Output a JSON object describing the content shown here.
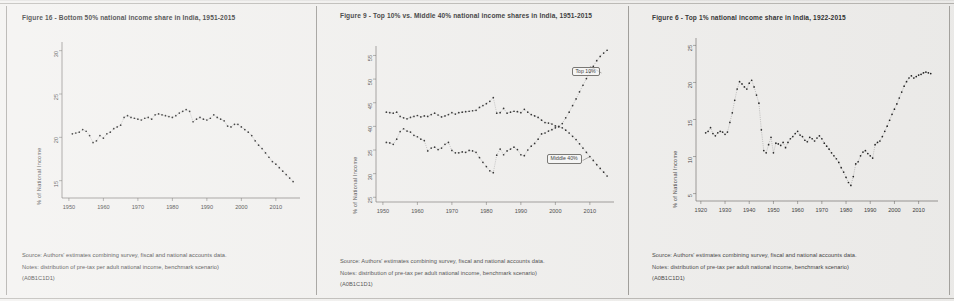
{
  "document": {
    "kind": "scanned-figure-sheet",
    "panel_count": 3
  },
  "common": {
    "ylabel": "% of National Income",
    "source_line": "Source: Authors' estimates combining survey, fiscal and national accounts data.",
    "notes_line": "Notes: distribution of pre-tax per adult national income, benchmark scenario)",
    "code_line": "(A0B1C1D1)"
  },
  "panels": [
    {
      "title": "Figure 16 - Bottom 50% national income share in India, 1951-2015",
      "source": "Source: Authors' estimates combining survey, fiscal and national accounts data.",
      "notes": "Notes: distribution of pre-tax per adult national income, benchmark scenario)",
      "code": "(A0B1C1D1)"
    },
    {
      "title": "Figure 9 - Top 10% vs. Middle 40% national income shares in India, 1951-2015",
      "source": "Source: Authors' estimates combining survey, fiscal and national accounts data.",
      "notes": "Notes: distribution of pre-tax per adult national income, benchmark scenario)",
      "code": "(A0B1C1D1)"
    },
    {
      "title": "Figure 6 - Top 1% national income share in India, 1922-2015",
      "source": "Source: Authors' estimates combining survey, fiscal and national accounts data.",
      "notes": "Notes: distribution of pre-tax per adult national income, benchmark scenario)",
      "code": "(A0B1C1D1)"
    }
  ],
  "chart_data": [
    {
      "type": "scatter",
      "title": "Figure 16 - Bottom 50% national income share in India, 1951-2015",
      "xlabel": "",
      "ylabel": "% of National Income",
      "grid": false,
      "legend": "none",
      "xlim": [
        1948,
        2017
      ],
      "ylim": [
        13,
        31
      ],
      "xticks": [
        1950,
        1960,
        1970,
        1980,
        1990,
        2000,
        2010
      ],
      "yticks": [
        15,
        20,
        25,
        30
      ],
      "series": [
        {
          "name": "Bottom 50%",
          "x": [
            1951,
            1952,
            1953,
            1954,
            1955,
            1956,
            1957,
            1958,
            1959,
            1960,
            1961,
            1962,
            1963,
            1964,
            1965,
            1966,
            1967,
            1968,
            1969,
            1970,
            1971,
            1972,
            1973,
            1974,
            1975,
            1976,
            1977,
            1978,
            1979,
            1980,
            1981,
            1982,
            1983,
            1984,
            1985,
            1986,
            1987,
            1988,
            1989,
            1990,
            1991,
            1992,
            1993,
            1994,
            1995,
            1996,
            1997,
            1998,
            1999,
            2000,
            2001,
            2002,
            2003,
            2004,
            2005,
            2006,
            2007,
            2008,
            2009,
            2010,
            2011,
            2012,
            2013,
            2014,
            2015
          ],
          "values": [
            20.4,
            20.5,
            20.6,
            20.9,
            20.7,
            20.2,
            19.4,
            19.6,
            20.2,
            19.9,
            20.4,
            20.6,
            21.0,
            21.2,
            21.4,
            22.3,
            22.5,
            22.3,
            22.2,
            22.1,
            22.0,
            22.2,
            22.3,
            22.1,
            22.6,
            22.7,
            22.6,
            22.5,
            22.4,
            22.3,
            22.5,
            22.8,
            23.0,
            23.2,
            23.0,
            21.8,
            22.1,
            22.3,
            22.1,
            22.0,
            22.2,
            22.6,
            22.3,
            22.1,
            21.9,
            21.3,
            21.2,
            21.5,
            21.5,
            21.2,
            20.9,
            20.6,
            20.2,
            19.6,
            19.1,
            18.7,
            18.2,
            17.7,
            17.2,
            16.9,
            16.5,
            16.1,
            15.7,
            15.3,
            14.9
          ]
        }
      ]
    },
    {
      "type": "scatter",
      "title": "Figure 9 - Top 10% vs. Middle 40% national income shares in India, 1951-2015",
      "xlabel": "",
      "ylabel": "% of National Income",
      "grid": false,
      "legend": "inline-annotations",
      "xlim": [
        1948,
        2017
      ],
      "ylim": [
        24,
        57
      ],
      "xticks": [
        1950,
        1960,
        1970,
        1980,
        1990,
        2000,
        2010
      ],
      "yticks": [
        25,
        30,
        35,
        40,
        45,
        50,
        55
      ],
      "annotations": [
        {
          "label": "Top 10%",
          "x": 2007,
          "y": 51.5
        },
        {
          "label": "Middle 40%",
          "x": 2005,
          "y": 33.0
        }
      ],
      "series": [
        {
          "name": "Middle 40%",
          "x": [
            1951,
            1952,
            1953,
            1954,
            1955,
            1956,
            1957,
            1958,
            1959,
            1960,
            1961,
            1962,
            1963,
            1964,
            1965,
            1966,
            1967,
            1968,
            1969,
            1970,
            1971,
            1972,
            1973,
            1974,
            1975,
            1976,
            1977,
            1978,
            1979,
            1980,
            1981,
            1982,
            1983,
            1984,
            1985,
            1986,
            1987,
            1988,
            1989,
            1990,
            1991,
            1992,
            1993,
            1994,
            1995,
            1996,
            1997,
            1998,
            1999,
            2000,
            2001,
            2002,
            2003,
            2004,
            2005,
            2006,
            2007,
            2008,
            2009,
            2010,
            2011,
            2012,
            2013,
            2014,
            2015
          ],
          "values": [
            43.0,
            42.9,
            42.8,
            43.0,
            42.1,
            41.8,
            41.6,
            41.9,
            42.1,
            42.3,
            42.0,
            42.2,
            42.1,
            42.5,
            42.8,
            42.4,
            42.0,
            42.2,
            42.5,
            42.9,
            42.6,
            42.9,
            43.0,
            43.1,
            43.2,
            43.3,
            43.4,
            44.0,
            44.4,
            44.8,
            45.3,
            46.1,
            42.8,
            42.9,
            43.8,
            42.8,
            43.0,
            43.2,
            43.1,
            42.9,
            43.6,
            43.0,
            42.5,
            42.2,
            41.9,
            41.3,
            40.8,
            40.7,
            40.5,
            40.1,
            39.9,
            39.7,
            39.2,
            38.6,
            37.9,
            37.2,
            36.3,
            35.4,
            34.5,
            33.6,
            32.8,
            31.9,
            31.1,
            30.3,
            29.5
          ]
        },
        {
          "name": "Top 10%",
          "x": [
            1951,
            1952,
            1953,
            1954,
            1955,
            1956,
            1957,
            1958,
            1959,
            1960,
            1961,
            1962,
            1963,
            1964,
            1965,
            1966,
            1967,
            1968,
            1969,
            1970,
            1971,
            1972,
            1973,
            1974,
            1975,
            1976,
            1977,
            1978,
            1979,
            1980,
            1981,
            1982,
            1983,
            1984,
            1985,
            1986,
            1987,
            1988,
            1989,
            1990,
            1991,
            1992,
            1993,
            1994,
            1995,
            1996,
            1997,
            1998,
            1999,
            2000,
            2001,
            2002,
            2003,
            2004,
            2005,
            2006,
            2007,
            2008,
            2009,
            2010,
            2011,
            2012,
            2013,
            2014,
            2015
          ],
          "values": [
            36.6,
            36.5,
            36.2,
            37.3,
            38.9,
            39.5,
            39.0,
            38.8,
            38.1,
            37.8,
            37.3,
            37.0,
            34.8,
            35.4,
            35.6,
            35.1,
            35.4,
            36.2,
            36.6,
            34.9,
            34.4,
            34.4,
            34.6,
            34.5,
            34.9,
            34.8,
            34.5,
            33.4,
            32.4,
            31.5,
            30.6,
            30.2,
            33.9,
            35.2,
            34.0,
            34.8,
            35.2,
            35.6,
            35.1,
            34.0,
            33.8,
            35.0,
            35.8,
            36.4,
            37.3,
            38.4,
            38.6,
            39.0,
            39.3,
            39.7,
            40.0,
            40.6,
            41.8,
            43.0,
            44.4,
            45.8,
            47.3,
            48.7,
            50.1,
            51.4,
            52.7,
            53.9,
            54.8,
            55.5,
            56.1
          ]
        }
      ]
    },
    {
      "type": "scatter",
      "title": "Figure 6 - Top 1% national income share in India, 1922-2015",
      "xlabel": "",
      "ylabel": "% of National Income",
      "grid": false,
      "legend": "none",
      "xlim": [
        1918,
        2018
      ],
      "ylim": [
        4,
        26
      ],
      "xticks": [
        1920,
        1930,
        1940,
        1950,
        1960,
        1970,
        1980,
        1990,
        2000,
        2010
      ],
      "yticks": [
        5,
        10,
        15,
        20,
        25
      ],
      "series": [
        {
          "name": "Top 1%",
          "x": [
            1922,
            1923,
            1924,
            1925,
            1926,
            1927,
            1928,
            1929,
            1930,
            1931,
            1932,
            1933,
            1934,
            1935,
            1936,
            1937,
            1938,
            1939,
            1940,
            1941,
            1942,
            1943,
            1944,
            1945,
            1946,
            1947,
            1948,
            1949,
            1950,
            1951,
            1952,
            1953,
            1954,
            1955,
            1956,
            1957,
            1958,
            1959,
            1960,
            1961,
            1962,
            1963,
            1964,
            1965,
            1966,
            1967,
            1968,
            1969,
            1970,
            1971,
            1972,
            1973,
            1974,
            1975,
            1976,
            1977,
            1978,
            1979,
            1980,
            1981,
            1982,
            1983,
            1984,
            1985,
            1986,
            1987,
            1988,
            1989,
            1990,
            1991,
            1992,
            1993,
            1994,
            1995,
            1996,
            1997,
            1998,
            1999,
            2000,
            2001,
            2002,
            2003,
            2004,
            2005,
            2006,
            2007,
            2008,
            2009,
            2010,
            2011,
            2012,
            2013,
            2014,
            2015
          ],
          "values": [
            13.2,
            13.4,
            13.9,
            13.1,
            12.8,
            13.2,
            13.4,
            13.3,
            13.0,
            13.3,
            14.6,
            15.9,
            17.6,
            19.1,
            20.1,
            19.8,
            19.4,
            19.1,
            19.9,
            20.3,
            19.4,
            18.3,
            17.2,
            13.6,
            10.8,
            10.5,
            11.6,
            12.6,
            10.5,
            11.8,
            11.7,
            11.5,
            11.9,
            11.2,
            11.9,
            12.4,
            12.7,
            13.1,
            13.4,
            12.9,
            12.7,
            12.2,
            12.0,
            12.6,
            12.4,
            12.1,
            12.5,
            12.8,
            12.4,
            11.8,
            11.4,
            11.0,
            10.5,
            10.1,
            9.7,
            9.2,
            8.5,
            7.9,
            7.2,
            6.5,
            6.1,
            7.3,
            9.0,
            9.3,
            10.1,
            10.6,
            10.8,
            10.4,
            10.1,
            9.8,
            11.6,
            11.9,
            12.1,
            12.7,
            13.4,
            14.1,
            14.9,
            15.7,
            16.4,
            17.1,
            17.9,
            18.7,
            19.5,
            20.1,
            20.6,
            20.9,
            20.6,
            20.8,
            21.0,
            21.1,
            21.3,
            21.4,
            21.3,
            21.2
          ]
        }
      ]
    }
  ]
}
